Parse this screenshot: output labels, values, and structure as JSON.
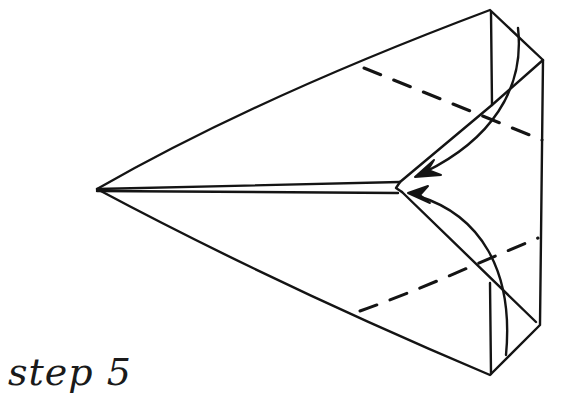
{
  "diagram": {
    "step_label": "step 5",
    "ink_color": "#141414",
    "background_color": "#ffffff",
    "elements": {
      "outline": "solid fold outline of airplane body",
      "center_crease": "central double line from nose to center",
      "top_fold_line": "dashed valley fold line (upper)",
      "bottom_fold_line": "dashed valley fold line (lower)",
      "top_arrow": "curved arrow folding top flap toward center",
      "bottom_arrow": "curved arrow folding bottom flap toward center"
    }
  }
}
